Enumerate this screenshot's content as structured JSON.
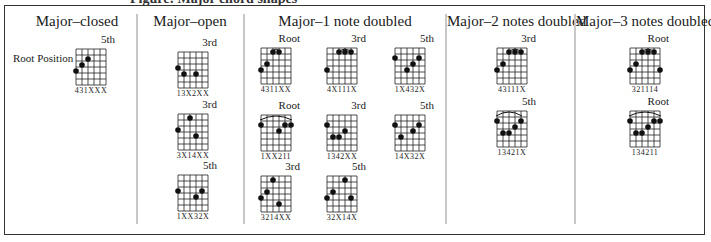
{
  "caption_partial": "Figure: Major chord shapes",
  "root_position_label": "Root Position",
  "columns": [
    {
      "title": "Major–closed",
      "chords": [
        {
          "label": "5th",
          "fingering": "431XXX",
          "dots": [
            [
              0,
              4
            ],
            [
              1,
              3
            ],
            [
              2,
              2
            ]
          ],
          "arc": null
        }
      ]
    },
    {
      "title": "Major–open",
      "chords": [
        {
          "label": "3rd",
          "fingering": "13X2XX",
          "dots": [
            [
              0,
              3
            ],
            [
              1,
              4
            ],
            [
              3,
              4
            ]
          ],
          "arc": null
        },
        {
          "label": "3rd",
          "fingering": "3X14XX",
          "dots": [
            [
              0,
              3
            ],
            [
              2,
              1
            ],
            [
              3,
              4
            ]
          ],
          "arc": null
        },
        {
          "label": "5th",
          "fingering": "1XX32X",
          "dots": [
            [
              0,
              3
            ],
            [
              3,
              4
            ],
            [
              4,
              3
            ]
          ],
          "arc": null
        }
      ]
    },
    {
      "title": "Major–1 note doubled",
      "chords": [
        {
          "label": "Root",
          "fingering": "4311XX",
          "dots": [
            [
              0,
              4
            ],
            [
              1,
              3
            ],
            [
              2,
              1
            ],
            [
              3,
              1
            ]
          ],
          "arc": [
            2,
            3
          ]
        },
        {
          "label": "3rd",
          "fingering": "4X111X",
          "dots": [
            [
              0,
              4
            ],
            [
              2,
              1
            ],
            [
              3,
              1
            ],
            [
              4,
              1
            ]
          ],
          "arc": [
            2,
            4
          ]
        },
        {
          "label": "5th",
          "fingering": "1X432X",
          "dots": [
            [
              0,
              2
            ],
            [
              2,
              4
            ],
            [
              3,
              3
            ],
            [
              4,
              2
            ]
          ],
          "arc": null
        },
        {
          "label": "Root",
          "fingering": "1XX211",
          "dots": [
            [
              0,
              2
            ],
            [
              3,
              3
            ],
            [
              4,
              2
            ],
            [
              5,
              2
            ]
          ],
          "arc": [
            0,
            5
          ]
        },
        {
          "label": "3rd",
          "fingering": "1342XX",
          "dots": [
            [
              0,
              2
            ],
            [
              1,
              4
            ],
            [
              2,
              4
            ],
            [
              3,
              3
            ]
          ],
          "arc": null
        },
        {
          "label": "5th",
          "fingering": "14X32X",
          "dots": [
            [
              0,
              2
            ],
            [
              1,
              4
            ],
            [
              3,
              3
            ],
            [
              4,
              2
            ]
          ],
          "arc": null
        },
        {
          "label": "3rd",
          "fingering": "3214XX",
          "dots": [
            [
              0,
              4
            ],
            [
              1,
              3
            ],
            [
              2,
              1
            ],
            [
              3,
              5
            ]
          ],
          "arc": null
        },
        {
          "label": "5th",
          "fingering": "32X14X",
          "dots": [
            [
              0,
              4
            ],
            [
              1,
              3
            ],
            [
              3,
              1
            ],
            [
              4,
              4
            ]
          ],
          "arc": null
        }
      ]
    },
    {
      "title": "Major–2 notes doubled",
      "chords": [
        {
          "label": "3rd",
          "fingering": "43111X",
          "dots": [
            [
              0,
              4
            ],
            [
              1,
              3
            ],
            [
              2,
              1
            ],
            [
              3,
              1
            ],
            [
              4,
              1
            ]
          ],
          "arc": [
            2,
            4
          ]
        },
        {
          "label": "5th",
          "fingering": "13421X",
          "dots": [
            [
              0,
              2
            ],
            [
              1,
              4
            ],
            [
              2,
              4
            ],
            [
              3,
              3
            ],
            [
              4,
              2
            ]
          ],
          "arc": [
            0,
            4
          ]
        }
      ]
    },
    {
      "title": "Major–3 notes doubled",
      "chords": [
        {
          "label": "Root",
          "fingering": "321114",
          "dots": [
            [
              0,
              4
            ],
            [
              1,
              3
            ],
            [
              2,
              1
            ],
            [
              3,
              1
            ],
            [
              4,
              1
            ],
            [
              5,
              4
            ]
          ],
          "arc": [
            2,
            4
          ]
        },
        {
          "label": "Root",
          "fingering": "134211",
          "dots": [
            [
              0,
              2
            ],
            [
              1,
              4
            ],
            [
              2,
              4
            ],
            [
              3,
              3
            ],
            [
              4,
              2
            ],
            [
              5,
              2
            ]
          ],
          "arc": [
            0,
            5
          ]
        }
      ]
    }
  ]
}
